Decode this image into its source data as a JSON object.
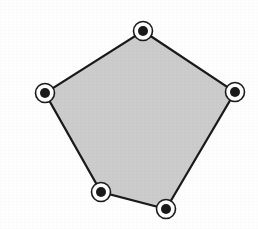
{
  "figure": {
    "shape_name": "pentagon",
    "canvas": {
      "width": 258,
      "height": 229
    },
    "background_color": "#fefefe",
    "fill_color": "#cccccc",
    "stroke_color": "#1a1a1a",
    "stroke_width": 2.2,
    "marker": {
      "outer_ring_radius": 9.5,
      "outer_ring_stroke_width": 1.6,
      "inner_white_radius": 7.8,
      "dot_radius": 5.0,
      "dot_color": "#1a1a1a",
      "ring_color": "#1a1a1a",
      "gap_color": "#ffffff"
    },
    "vertices": [
      {
        "label": "top",
        "name": "vertex-top",
        "x": 143,
        "y": 31
      },
      {
        "label": "right",
        "name": "vertex-right",
        "x": 235,
        "y": 92
      },
      {
        "label": "bottom-right",
        "name": "vertex-bottom-right",
        "x": 166,
        "y": 209
      },
      {
        "label": "bottom-left",
        "name": "vertex-bottom-left",
        "x": 101,
        "y": 192
      },
      {
        "label": "left",
        "name": "vertex-left",
        "x": 45,
        "y": 93
      }
    ],
    "edges": [
      {
        "name": "edge-top-right",
        "from": "top",
        "to": "right"
      },
      {
        "name": "edge-right-bottomright",
        "from": "right",
        "to": "bottom-right"
      },
      {
        "name": "edge-bottomright-bottomleft",
        "from": "bottom-right",
        "to": "bottom-left"
      },
      {
        "name": "edge-bottomleft-left",
        "from": "bottom-left",
        "to": "left"
      },
      {
        "name": "edge-left-top",
        "from": "left",
        "to": "top"
      }
    ],
    "points_polygon": "143,31 235,92 166,209 101,192 45,93"
  }
}
